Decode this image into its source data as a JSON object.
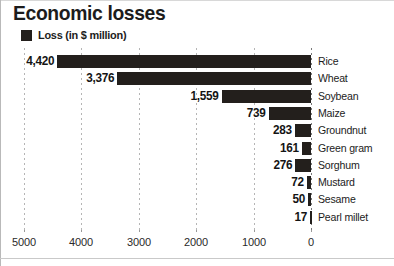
{
  "header": {
    "title": "Economic losses",
    "legend": {
      "swatch_icon": "legend-square-icon",
      "swatch_color": "#231f1c",
      "label": "Loss (in $ million)"
    }
  },
  "chart_data": {
    "type": "bar",
    "orientation": "horizontal",
    "title": "Economic losses",
    "xlabel": "",
    "ylabel": "",
    "legend": [
      "Loss (in $ million)"
    ],
    "legend_position": "top-left",
    "grid": true,
    "x_axis_reversed": true,
    "xlim": [
      5000,
      0
    ],
    "xticks": [
      5000,
      4000,
      3000,
      2000,
      1000,
      0
    ],
    "xtick_labels": [
      "5000",
      "4000",
      "3000",
      "2000",
      "1000",
      "0"
    ],
    "categories": [
      "Rice",
      "Wheat",
      "Soybean",
      "Maize",
      "Groundnut",
      "Green gram",
      "Sorghum",
      "Mustard",
      "Sesame",
      "Pearl millet"
    ],
    "values": [
      4420,
      3376,
      1559,
      739,
      283,
      161,
      276,
      72,
      50,
      17
    ],
    "value_labels": [
      "4,420",
      "3,376",
      "1,559",
      "739",
      "283",
      "161",
      "276",
      "72",
      "50",
      "17"
    ],
    "bar_color": "#231f1c",
    "background_color": "#ffffff"
  }
}
